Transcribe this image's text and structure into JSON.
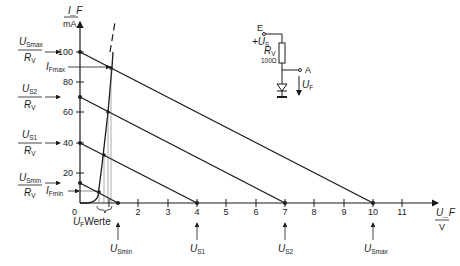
{
  "diagram": {
    "y_axis": {
      "label_top": "I_F",
      "label_bottom": "mA",
      "ticks": [
        "100",
        "80",
        "60",
        "40",
        "20"
      ]
    },
    "x_axis": {
      "label_top": "U_F",
      "label_bottom": "V",
      "ticks": [
        "0",
        "1",
        "2",
        "3",
        "4",
        "5",
        "6",
        "7",
        "8",
        "9",
        "10",
        "11"
      ]
    },
    "origin_label": "0",
    "uf_values_label": "Werte",
    "uf_values_prefix": "U",
    "uf_values_sub": "F",
    "left_labels": [
      {
        "num": "U",
        "num_sub": "Smax",
        "den": "R",
        "den_sub": "V",
        "value": 100
      },
      {
        "num": "U",
        "num_sub": "S2",
        "den": "R",
        "den_sub": "V",
        "value": 70
      },
      {
        "num": "U",
        "num_sub": "S1",
        "den": "R",
        "den_sub": "V",
        "value": 40
      },
      {
        "num": "U",
        "num_sub": "Smin",
        "den": "R",
        "den_sub": "V",
        "value": 13
      }
    ],
    "current_marks": [
      {
        "label": "I",
        "sub": "Fmax",
        "value_mA": 88
      },
      {
        "label": "I",
        "sub": "Fmin",
        "value_mA": 9
      }
    ],
    "bottom_labels": [
      {
        "label": "U",
        "sub": "Smin",
        "value_V": 1.3
      },
      {
        "label": "U",
        "sub": "S1",
        "value_V": 4
      },
      {
        "label": "U",
        "sub": "S2",
        "value_V": 7
      },
      {
        "label": "U",
        "sub": "Smax",
        "value_V": 10
      }
    ],
    "circuit": {
      "input_label": "E",
      "supply_label": "+U",
      "supply_sub": "S",
      "resistor_label": "R",
      "resistor_sub": "V",
      "resistor_value": "100Ω",
      "output_label": "A",
      "voltage_label": "U",
      "voltage_sub": "F"
    }
  }
}
